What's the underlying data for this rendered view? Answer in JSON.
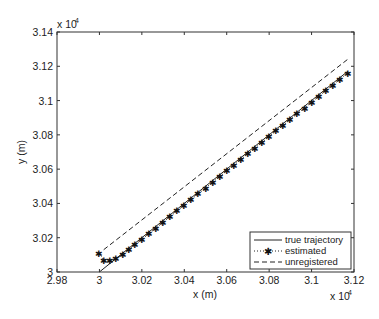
{
  "chart_data": {
    "type": "line",
    "title": "",
    "xlabel": "x (m)",
    "ylabel": "y (m)",
    "x_multiplier": "x 10^4",
    "y_multiplier": "x 10^4",
    "xlim": [
      2.98,
      3.12
    ],
    "ylim": [
      3.0,
      3.14
    ],
    "xticks": [
      "2.98",
      "3",
      "3.02",
      "3.04",
      "3.06",
      "3.08",
      "3.1",
      "3.12"
    ],
    "yticks": [
      "3",
      "3.02",
      "3.04",
      "3.06",
      "3.08",
      "3.1",
      "3.12",
      "3.14"
    ],
    "grid": false,
    "legend_position": "lower right",
    "series": [
      {
        "name": "true trajectory",
        "style": "solid",
        "x": [
          3.0,
          3.117
        ],
        "y": [
          3.0,
          3.117
        ]
      },
      {
        "name": "estimated",
        "style": "dotted-star",
        "x": [
          3.0,
          3.002,
          3.005,
          3.008,
          3.011,
          3.014,
          3.017,
          3.02,
          3.03,
          3.04,
          3.05,
          3.06,
          3.07,
          3.08,
          3.09,
          3.1,
          3.11,
          3.117
        ],
        "y": [
          3.011,
          3.007,
          3.007,
          3.008,
          3.01,
          3.013,
          3.016,
          3.019,
          3.029,
          3.039,
          3.049,
          3.059,
          3.069,
          3.079,
          3.089,
          3.099,
          3.109,
          3.116
        ]
      },
      {
        "name": "unregistered",
        "style": "dashed",
        "x": [
          3.002,
          3.117
        ],
        "y": [
          3.013,
          3.124
        ]
      }
    ]
  },
  "legend": {
    "items": [
      "true trajectory",
      "estimated",
      "unregistered"
    ]
  },
  "axes": {
    "xlabel": "x (m)",
    "ylabel": "y (m)",
    "exp_base": "x 10",
    "exp_power": "4"
  }
}
